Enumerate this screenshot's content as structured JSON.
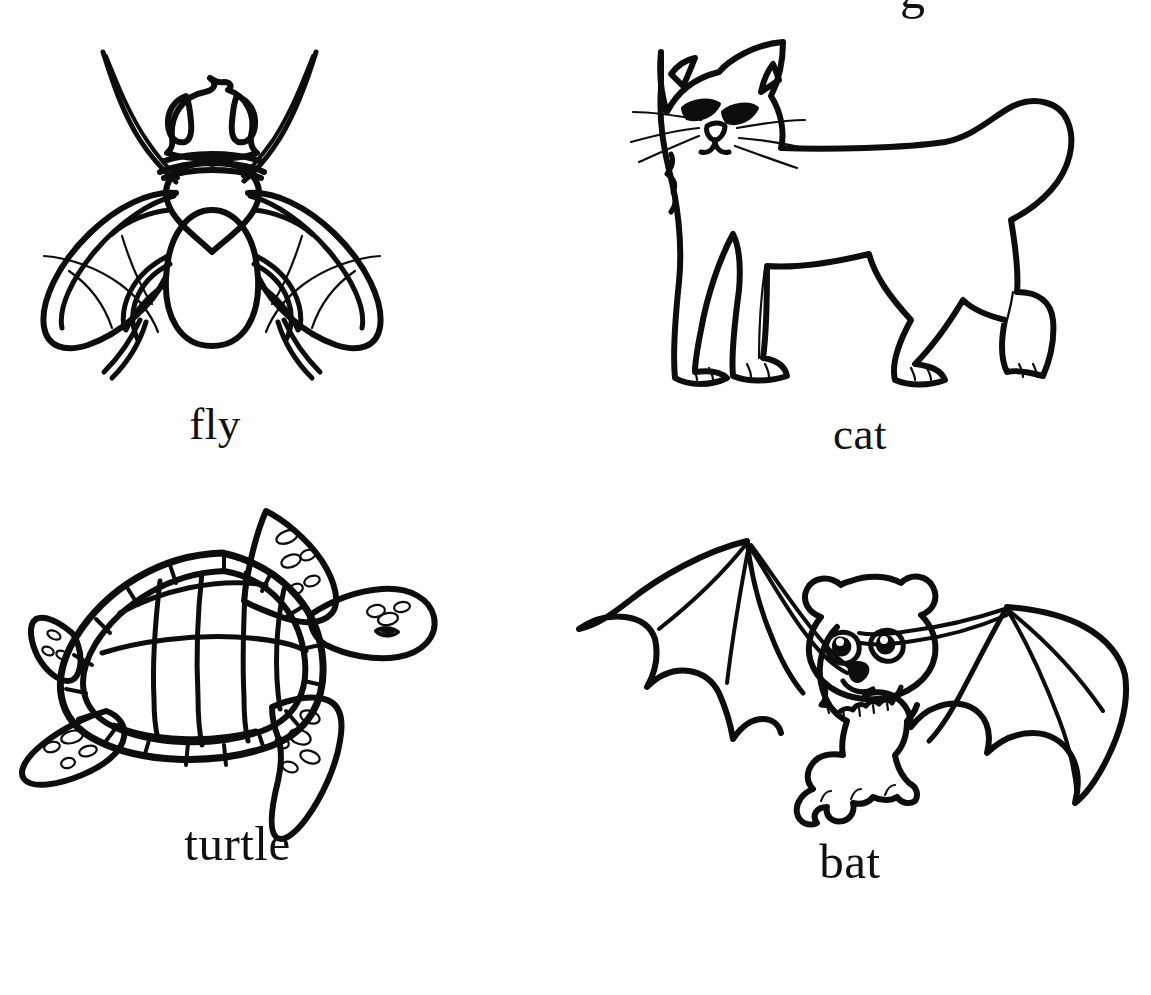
{
  "page": {
    "background_color": "#ffffff",
    "ink_color": "#0d0d0d",
    "layout": "2x2 grid of labelled line-art animal pictures",
    "partial_top_glyph": "g"
  },
  "cards": [
    {
      "id": "fly",
      "label": "fly",
      "icon_name": "fly-line-art",
      "position": "top-left",
      "description": "black outline drawing of a housefly viewed from above with two antennae, large compound eyes, thorax, abdomen, two veined wings and six legs"
    },
    {
      "id": "cat",
      "label": "cat",
      "icon_name": "cat-line-art",
      "position": "top-right",
      "description": "black outline drawing of a standing cat in side profile with pointed ears, whiskers, and a curled upright tail"
    },
    {
      "id": "turtle",
      "label": "turtle",
      "icon_name": "turtle-line-art",
      "position": "bottom-left",
      "description": "black outline drawing of a sea turtle seen from above with a segmented shell, four spotted flippers and a spotted head"
    },
    {
      "id": "bat",
      "label": "bat",
      "icon_name": "bat-line-art",
      "position": "bottom-right",
      "description": "black outline drawing of a cartoon bat with round ears, big eyes, furry chest and two outstretched membranous wings"
    }
  ]
}
